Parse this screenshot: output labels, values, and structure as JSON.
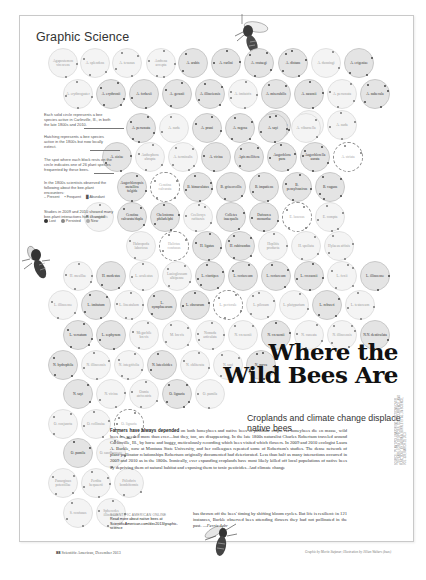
{
  "page": {
    "section_title": "Graphic Science",
    "headline_line1": "Where the",
    "headline_line2": "Wild Bees Are",
    "subheadline": "Croplands and climate change displace native bees",
    "body_lead": "Farmers have always depended",
    "body": "on both honeybees and native bees to pollinate crops. As honeybees die en masse, wild bees are needed more than ever—but they, too, are disappearing. In the late 1800s naturalist Charles Robertson traveled around Carlinville, Ill., by horse and buggy, meticulously recording which bees visited which flowers. In 2009 and 2010 ecologist Laura A. Burkle, now at Montana State University, and her colleagues repeated some of Robertson's studies. The dense network of plant-pollinator relationships Robertson originally documented had deteriorated. Less than half as many interactions occurred in 2009 and 2010 as in the 1800s. Ironically, ever expanding croplands have most likely killed off local populations of native bees by depriving them of natural habitat and exposing them to toxic pesticides. And climate change",
    "body_continued": "has thrown off the bees' timing by shifting bloom cycles. But life is resilient: in 121 instances, Burkle observed bees attending flowers they had not pollinated in the past.",
    "author": "—Ferris Jabr",
    "online_label": "SCIENTIFIC AMERICAN ONLINE",
    "online_text": "Read more about native bees at ScientificAmerican.com/dec2013/graphic-science",
    "footer_page": "88",
    "footer_pub": "Scientific American, December 2013",
    "footer_credit": "Graphic by Moritz Stefaner; Illustration by Jillian Walters (bees)",
    "source_credit": "SOURCE: \"PLANT-POLLINATOR INTERACTIONS OVER 120 YEARS: LOSS OF SPECIES, CO-OCCURRENCE, AND FUNCTION,\" BY LAURA A. BURKLE ET AL., IN SCIENCE, VOL. 339; MARCH 29, 2013"
  },
  "legend": {
    "solid": "Each solid circle represents a bee species active in Carlinville, Ill., in both the late 1800s and 2010.",
    "hatched": "Hatching represents a bee species active in the 1800s but now locally extinct.",
    "ticks": "The spot where each block rests on the circle indicates one of 26 plant species frequented by these bees.",
    "observed": "In the 1800s scientists observed the following about the bee-plant encounters:",
    "keys_1800": [
      "Present",
      "Frequent",
      "Abundant"
    ],
    "changed": "Studies in 2009 and 2010 showed many bee-plant interactions had changed:",
    "keys_2010": [
      "Lost",
      "Persisted",
      "New"
    ]
  },
  "circles": [
    {
      "label": "Agapostemon virescens",
      "x": 48,
      "y": 48,
      "style": "hatch"
    },
    {
      "label": "A. splendens",
      "x": 80,
      "y": 48,
      "style": "hatch"
    },
    {
      "label": "A. texanus",
      "x": 112,
      "y": 48,
      "style": "hatch"
    },
    {
      "label": "Andrena accepta",
      "x": 146,
      "y": 48,
      "style": "hatch"
    },
    {
      "label": "A. arabis",
      "x": 178,
      "y": 48,
      "style": "solid"
    },
    {
      "label": "A. carlini",
      "x": 211,
      "y": 48,
      "style": "solid"
    },
    {
      "label": "A. crataegi",
      "x": 244,
      "y": 48,
      "style": "solid"
    },
    {
      "label": "A. distans",
      "x": 278,
      "y": 48,
      "style": "solid"
    },
    {
      "label": "A. dunningi",
      "x": 311,
      "y": 48,
      "style": "hatch"
    },
    {
      "label": "A. erigeniae",
      "x": 344,
      "y": 48,
      "style": "solid"
    },
    {
      "label": "A. erythrogaster",
      "x": 63,
      "y": 79,
      "style": "hatch"
    },
    {
      "label": "A. erythronii",
      "x": 96,
      "y": 79,
      "style": "solid"
    },
    {
      "label": "A. forbesii",
      "x": 129,
      "y": 79,
      "style": "solid"
    },
    {
      "label": "A. geranii",
      "x": 162,
      "y": 79,
      "style": "solid"
    },
    {
      "label": "A. illinoiensis",
      "x": 195,
      "y": 79,
      "style": "solid"
    },
    {
      "label": "A. imitatrix",
      "x": 228,
      "y": 79,
      "style": "hatch"
    },
    {
      "label": "A. miserabilis",
      "x": 261,
      "y": 79,
      "style": "solid"
    },
    {
      "label": "A. nasonii",
      "x": 294,
      "y": 79,
      "style": "solid"
    },
    {
      "label": "A. personata",
      "x": 327,
      "y": 79,
      "style": "hatch"
    },
    {
      "label": "A. nubecula",
      "x": 360,
      "y": 79,
      "style": "solid"
    },
    {
      "label": "A. mandibularis",
      "x": 261,
      "y": 110,
      "style": "solid"
    },
    {
      "label": "A. personata",
      "x": 294,
      "y": 110,
      "style": "hatch"
    },
    {
      "label": "A. nuda",
      "x": 327,
      "y": 110,
      "style": "hatch"
    },
    {
      "label": "A. personata",
      "x": 126,
      "y": 113,
      "style": "solid"
    },
    {
      "label": "A. nuda",
      "x": 159,
      "y": 113,
      "style": "hatch"
    },
    {
      "label": "A. pruni",
      "x": 192,
      "y": 113,
      "style": "solid"
    },
    {
      "label": "A. rugosa",
      "x": 225,
      "y": 113,
      "style": "solid"
    },
    {
      "label": "A. sayi",
      "x": 258,
      "y": 113,
      "style": "solid"
    },
    {
      "label": "A. viburnella",
      "x": 291,
      "y": 113,
      "style": "hatch"
    },
    {
      "label": "A. ziziae",
      "x": 102,
      "y": 142,
      "style": "solid"
    },
    {
      "label": "Anthophora abrupta",
      "x": 135,
      "y": 142,
      "style": "hatch"
    },
    {
      "label": "A. terminalis",
      "x": 168,
      "y": 142,
      "style": "hatch"
    },
    {
      "label": "A. vicina",
      "x": 201,
      "y": 142,
      "style": "solid"
    },
    {
      "label": "Apis mellifera",
      "x": 234,
      "y": 142,
      "style": "solid"
    },
    {
      "label": "Augochlora pura",
      "x": 267,
      "y": 142,
      "style": "solid"
    },
    {
      "label": "Augochlorella aurata",
      "x": 300,
      "y": 142,
      "style": "solid"
    },
    {
      "label": "A. striata",
      "x": 333,
      "y": 142,
      "style": "dashed"
    },
    {
      "label": "Augochloropsis metallica fulgida",
      "x": 117,
      "y": 172,
      "style": "solid"
    },
    {
      "label": "Ceratina calcarata",
      "x": 150,
      "y": 172,
      "style": "dashed"
    },
    {
      "label": "B. bimaculatus",
      "x": 183,
      "y": 172,
      "style": "solid"
    },
    {
      "label": "B. griseocollis",
      "x": 216,
      "y": 172,
      "style": "solid"
    },
    {
      "label": "B. impatiens",
      "x": 249,
      "y": 172,
      "style": "solid"
    },
    {
      "label": "B. pensylvanicus",
      "x": 282,
      "y": 172,
      "style": "solid"
    },
    {
      "label": "B. vagans",
      "x": 315,
      "y": 172,
      "style": "solid"
    },
    {
      "label": "B. variabilis",
      "x": 84,
      "y": 202,
      "style": "hatch"
    },
    {
      "label": "Ceratina calcarata/dupla",
      "x": 117,
      "y": 202,
      "style": "solid"
    },
    {
      "label": "Chelostoma philadelphi",
      "x": 150,
      "y": 202,
      "style": "solid"
    },
    {
      "label": "Coelioxys rufitarsis",
      "x": 183,
      "y": 202,
      "style": "hatch"
    },
    {
      "label": "Colletes inaequalis",
      "x": 216,
      "y": 202,
      "style": "solid"
    },
    {
      "label": "Dufourea monardae",
      "x": 249,
      "y": 202,
      "style": "solid"
    },
    {
      "label": "E. lanosus",
      "x": 282,
      "y": 202,
      "style": "dashed"
    },
    {
      "label": "E. compta",
      "x": 315,
      "y": 202,
      "style": "hatch"
    },
    {
      "label": "Habropoda laboriosa",
      "x": 126,
      "y": 231,
      "style": "hatch"
    },
    {
      "label": "Halictus confusus",
      "x": 159,
      "y": 231,
      "style": "dashed"
    },
    {
      "label": "H. ligatus",
      "x": 192,
      "y": 231,
      "style": "solid"
    },
    {
      "label": "H. rubicundus",
      "x": 225,
      "y": 231,
      "style": "solid"
    },
    {
      "label": "Hoplitis producta",
      "x": 258,
      "y": 231,
      "style": "hatch"
    },
    {
      "label": "H. spoliata",
      "x": 291,
      "y": 231,
      "style": "hatch"
    },
    {
      "label": "Hylaeus affinis",
      "x": 324,
      "y": 231,
      "style": "hatch"
    },
    {
      "label": "H. mesillae",
      "x": 63,
      "y": 261,
      "style": "hatch"
    },
    {
      "label": "H. modestus",
      "x": 96,
      "y": 261,
      "style": "solid"
    },
    {
      "label": "L. aculeatus",
      "x": 129,
      "y": 261,
      "style": "hatch"
    },
    {
      "label": "Lasioglossum albipenne",
      "x": 162,
      "y": 261,
      "style": "hatch"
    },
    {
      "label": "L. cinctipes",
      "x": 195,
      "y": 261,
      "style": "solid"
    },
    {
      "label": "L. coriaceum",
      "x": 228,
      "y": 261,
      "style": "solid"
    },
    {
      "label": "L. coriaceum",
      "x": 261,
      "y": 261,
      "style": "solid"
    },
    {
      "label": "L. cressonii",
      "x": 294,
      "y": 261,
      "style": "solid"
    },
    {
      "label": "L. foxii",
      "x": 327,
      "y": 261,
      "style": "hatch"
    },
    {
      "label": "L. illinoense",
      "x": 360,
      "y": 261,
      "style": "solid"
    },
    {
      "label": "L. illinoense",
      "x": 48,
      "y": 290,
      "style": "hatch"
    },
    {
      "label": "L. imitatum",
      "x": 81,
      "y": 290,
      "style": "solid"
    },
    {
      "label": "L. lineatulum",
      "x": 114,
      "y": 290,
      "style": "hatch"
    },
    {
      "label": "L. nymphaearum",
      "x": 147,
      "y": 290,
      "style": "solid"
    },
    {
      "label": "L. obscurum",
      "x": 180,
      "y": 290,
      "style": "solid"
    },
    {
      "label": "L. pectorale",
      "x": 213,
      "y": 290,
      "style": "dashed"
    },
    {
      "label": "L. pilosum",
      "x": 246,
      "y": 290,
      "style": "hatch"
    },
    {
      "label": "L. platyparium",
      "x": 279,
      "y": 290,
      "style": "hatch"
    },
    {
      "label": "L. rohweri",
      "x": 312,
      "y": 290,
      "style": "solid"
    },
    {
      "label": "L. testaceum",
      "x": 345,
      "y": 290,
      "style": "hatch"
    },
    {
      "label": "L. versatum",
      "x": 63,
      "y": 320,
      "style": "solid"
    },
    {
      "label": "L. zephyrum",
      "x": 96,
      "y": 320,
      "style": "solid"
    },
    {
      "label": "Megachile brevis",
      "x": 129,
      "y": 320,
      "style": "hatch"
    },
    {
      "label": "M. brevis",
      "x": 162,
      "y": 320,
      "style": "hatch"
    },
    {
      "label": "Nomada articulata",
      "x": 195,
      "y": 320,
      "style": "hatch"
    },
    {
      "label": "N. cressonii",
      "x": 228,
      "y": 320,
      "style": "hatch"
    },
    {
      "label": "N. cressonii",
      "x": 261,
      "y": 320,
      "style": "solid"
    },
    {
      "label": "N. cuneata",
      "x": 294,
      "y": 320,
      "style": "hatch"
    },
    {
      "label": "N. illinoensis",
      "x": 327,
      "y": 320,
      "style": "hatch"
    },
    {
      "label": "N.N. denticulata",
      "x": 360,
      "y": 320,
      "style": "solid"
    },
    {
      "label": "N. hydrophila",
      "x": 48,
      "y": 350,
      "style": "solid"
    },
    {
      "label": "N. illinoensis",
      "x": 81,
      "y": 350,
      "style": "hatch"
    },
    {
      "label": "N. integrifolia",
      "x": 114,
      "y": 350,
      "style": "hatch"
    },
    {
      "label": "N. luteoloides",
      "x": 147,
      "y": 350,
      "style": "solid"
    },
    {
      "label": "N. obliterata",
      "x": 180,
      "y": 350,
      "style": "hatch"
    },
    {
      "label": "N. sayi",
      "x": 213,
      "y": 350,
      "style": "hatch"
    },
    {
      "label": "N. parva",
      "x": 246,
      "y": 350,
      "style": "solid"
    },
    {
      "label": "N. sayi",
      "x": 63,
      "y": 379,
      "style": "solid"
    },
    {
      "label": "N. vicina",
      "x": 96,
      "y": 379,
      "style": "hatch"
    },
    {
      "label": "Osmia atriventris",
      "x": 129,
      "y": 379,
      "style": "hatch"
    },
    {
      "label": "O. lignaria",
      "x": 162,
      "y": 379,
      "style": "solid"
    },
    {
      "label": "O. pumila",
      "x": 195,
      "y": 379,
      "style": "hatch"
    },
    {
      "label": "O. conjuncta",
      "x": 48,
      "y": 409,
      "style": "hatch"
    },
    {
      "label": "O. collinsiae",
      "x": 81,
      "y": 409,
      "style": "hatch"
    },
    {
      "label": "O. lignaria",
      "x": 114,
      "y": 409,
      "style": "dashed"
    },
    {
      "label": "O. pumila",
      "x": 63,
      "y": 438,
      "style": "solid"
    },
    {
      "label": "O. sandhouseae",
      "x": 96,
      "y": 438,
      "style": "hatch"
    },
    {
      "label": "Panurginus potentillae",
      "x": 48,
      "y": 468,
      "style": "hatch"
    },
    {
      "label": "Perdita bequaerti",
      "x": 81,
      "y": 468,
      "style": "hatch"
    },
    {
      "label": "Ptilothrix bombiformis",
      "x": 114,
      "y": 468,
      "style": "hatch"
    },
    {
      "label": "S. confusus",
      "x": 63,
      "y": 498,
      "style": "hatch"
    },
    {
      "label": "Sphecodes illinoensis",
      "x": 96,
      "y": 498,
      "style": "hatch"
    }
  ],
  "colors": {
    "solid_circle": "#e4e4e4",
    "hatched_circle": "#f4f4f4",
    "text_dark": "#111111",
    "text_muted": "#9a9a9a",
    "frame": "#c9c9c9"
  }
}
